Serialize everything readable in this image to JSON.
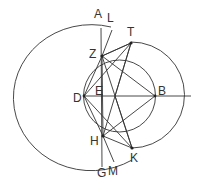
{
  "diagram": {
    "labels": {
      "A": "A",
      "L": "L",
      "T": "T",
      "Z": "Z",
      "D": "D",
      "E": "E",
      "B": "B",
      "H": "H",
      "K": "K",
      "G": "G",
      "M": "M"
    },
    "segments": [
      [
        "A",
        "G"
      ],
      [
        "D",
        "B"
      ],
      [
        "B",
        "right"
      ],
      [
        "Z",
        "T"
      ],
      [
        "H",
        "K"
      ],
      [
        "D",
        "Z"
      ],
      [
        "D",
        "T"
      ],
      [
        "D",
        "H"
      ],
      [
        "D",
        "K"
      ],
      [
        "Z",
        "B"
      ],
      [
        "H",
        "B"
      ],
      [
        "Z",
        "K"
      ],
      [
        "T",
        "H"
      ],
      [
        "Z",
        "L"
      ],
      [
        "H",
        "M"
      ],
      [
        "T",
        "X"
      ],
      [
        "K",
        "X"
      ],
      [
        "Z",
        "X"
      ],
      [
        "H",
        "X"
      ]
    ],
    "stroke_color": "#333333"
  }
}
